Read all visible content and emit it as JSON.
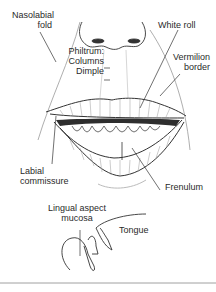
{
  "figure": {
    "labels": {
      "nasolabial_fold": [
        "Nasolabial",
        "fold"
      ],
      "philtrum": "Philtrum:",
      "columns": "Columns",
      "dimple": "Dimple",
      "white_roll": "White roll",
      "vermilion_border": [
        "Vermilion",
        "border"
      ],
      "labial_commissure": [
        "Labial",
        "commissure"
      ],
      "frenulum": "Frenulum",
      "lingual_aspect_mucosa": [
        "Lingual aspect",
        "mucosa"
      ],
      "tongue": "Tongue"
    },
    "colors": {
      "line": "#333333",
      "hatch": "#9a9a9a",
      "text": "#2a2a2a",
      "divider": "#888888"
    }
  }
}
